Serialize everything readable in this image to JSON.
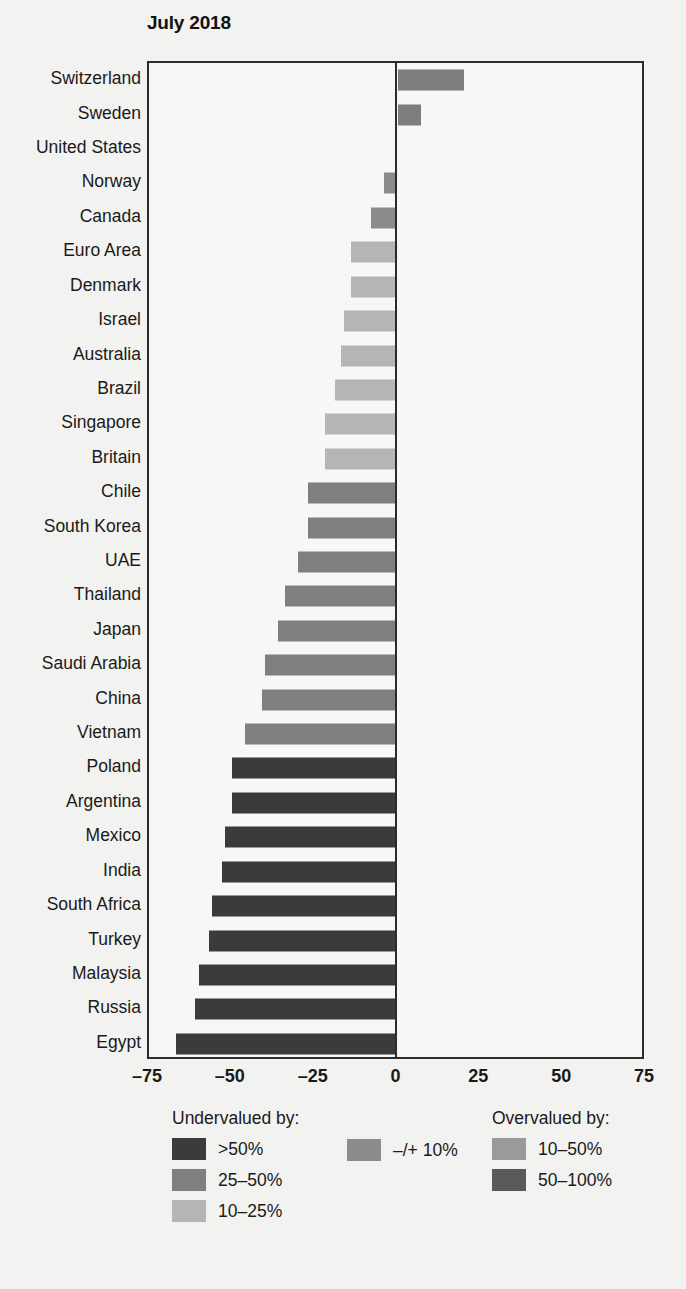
{
  "chart": {
    "title": "July 2018"
  },
  "axis": {
    "xticks": [
      "–75",
      "–50",
      "–25",
      "0",
      "25",
      "50",
      "75"
    ],
    "xtick_values": [
      -75,
      -50,
      -25,
      0,
      25,
      50,
      75
    ]
  },
  "legend": {
    "undervalued_heading": "Undervalued by:",
    "overvalued_heading": "Overvalued by:",
    "entries_undervalued": [
      {
        "label": ">50%",
        "color": "#3b3b3b"
      },
      {
        "label": "25–50%",
        "color": "#7f7f7f"
      },
      {
        "label": "10–25%",
        "color": "#b5b5b5"
      }
    ],
    "entries_neutral": [
      {
        "label": "–/+ 10%",
        "color": "#8c8c8c"
      }
    ],
    "entries_overvalued": [
      {
        "label": "10–50%",
        "color": "#9a9a9a"
      },
      {
        "label": "50–100%",
        "color": "#595959"
      }
    ]
  },
  "chart_data": {
    "type": "bar",
    "orientation": "horizontal",
    "title": "July 2018",
    "xlabel": "",
    "ylabel": "",
    "xlim": [
      -75,
      75
    ],
    "grid": false,
    "legend_position": "bottom",
    "categories": [
      "Switzerland",
      "Sweden",
      "United States",
      "Norway",
      "Canada",
      "Euro Area",
      "Denmark",
      "Israel",
      "Australia",
      "Brazil",
      "Singapore",
      "Britain",
      "Chile",
      "South Korea",
      "UAE",
      "Thailand",
      "Japan",
      "Saudi Arabia",
      "China",
      "Vietnam",
      "Poland",
      "Argentina",
      "Mexico",
      "India",
      "South Africa",
      "Turkey",
      "Malaysia",
      "Russia",
      "Egypt"
    ],
    "values": [
      20,
      7,
      0,
      -4,
      -8,
      -14,
      -14,
      -16,
      -17,
      -19,
      -22,
      -22,
      -27,
      -27,
      -30,
      -34,
      -36,
      -40,
      -41,
      -46,
      -50,
      -50,
      -52,
      -53,
      -56,
      -57,
      -60,
      -61,
      -67
    ],
    "colors": [
      "#7d7d7d",
      "#7d7d7d",
      "#8c8c8c",
      "#8c8c8c",
      "#8c8c8c",
      "#b5b5b5",
      "#b5b5b5",
      "#b5b5b5",
      "#b5b5b5",
      "#b5b5b5",
      "#b5b5b5",
      "#b5b5b5",
      "#7f7f7f",
      "#7f7f7f",
      "#7f7f7f",
      "#7f7f7f",
      "#7f7f7f",
      "#7f7f7f",
      "#7f7f7f",
      "#7f7f7f",
      "#3b3b3b",
      "#3b3b3b",
      "#3b3b3b",
      "#3b3b3b",
      "#3b3b3b",
      "#3b3b3b",
      "#3b3b3b",
      "#3b3b3b",
      "#3b3b3b"
    ]
  }
}
